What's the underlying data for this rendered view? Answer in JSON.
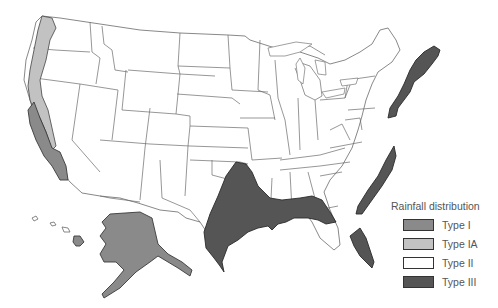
{
  "legend": {
    "title": "Rainfall distribution",
    "items": [
      {
        "label": "Type I",
        "color": "#8a8a8a"
      },
      {
        "label": "Type IA",
        "color": "#c2c2c2"
      },
      {
        "label": "Type II",
        "color": "#ffffff"
      },
      {
        "label": "Type III",
        "color": "#555555"
      }
    ]
  },
  "regions": {
    "type_i": [
      "Southern California coast",
      "Alaska",
      "Hawaii"
    ],
    "type_ia": [
      "Pacific Northwest coast",
      "Northern California coast"
    ],
    "type_ii": [
      "Interior and most of contiguous United States"
    ],
    "type_iii": [
      "Gulf Coast",
      "Florida peninsula",
      "Atlantic coast (Carolinas)",
      "Northeast coast (New Jersey to Maine)"
    ]
  }
}
